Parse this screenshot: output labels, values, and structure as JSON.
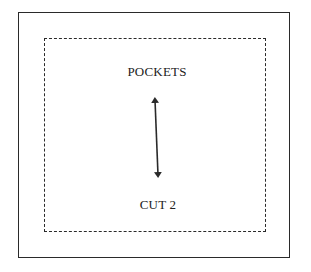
{
  "diagram": {
    "type": "sewing-pattern-piece",
    "piece_name": "POCKETS",
    "cut_instruction": "CUT 2",
    "grainline": {
      "icon": "double-headed-arrow-icon",
      "from": [
        155,
        97
      ],
      "to": [
        158,
        178
      ]
    },
    "outer_border": "solid",
    "inner_border": "dashed",
    "colors": {
      "line": "#2a2a2a",
      "text": "#222222",
      "background": "#ffffff"
    }
  }
}
